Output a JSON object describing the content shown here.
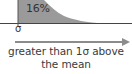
{
  "diagram": {
    "type": "normal-distribution-right-tail",
    "tail_area_label": "16%",
    "tick_label": "σ",
    "caption": {
      "line1": "greater than 1σ above",
      "line2": "the mean"
    },
    "colors": {
      "tail_fill": "#9a9a9a",
      "axis": "#444444",
      "arrow": "#8c8c8c",
      "text": "#333333",
      "background": "#ffffff"
    }
  }
}
